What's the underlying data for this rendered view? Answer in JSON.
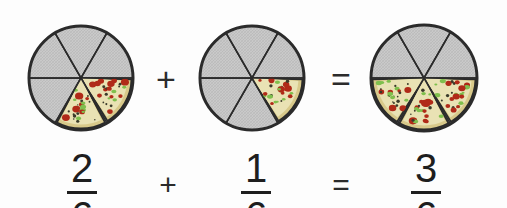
{
  "colors": {
    "background": "#fdfdfd",
    "empty_slice_fill": "#c9c9c9",
    "empty_slice_texture": "#b5b5b5",
    "crust_outer": "#2b2b2b",
    "crust_inner": "#d8c98a",
    "cheese": "#e9e2b4",
    "pepperoni": "#b02a18",
    "pepper_green": "#7fbf4d",
    "olive": "#3a3a2a",
    "slice_divider": "#2b2b2b",
    "text": "#1e1e1e"
  },
  "geometry": {
    "slices_total": 6,
    "slice_angle_degrees": 60,
    "radius": 52
  },
  "equation_top": {
    "operator_1": "+",
    "operator_2": "="
  },
  "equation_bottom": {
    "operator_1": "+",
    "operator_2": "="
  },
  "models": [
    {
      "name": "first-addend",
      "center_x": 81,
      "center_y": 78,
      "radius": 52,
      "slices_total": 6,
      "slices_filled": 2,
      "filled_indices": [
        0,
        1
      ],
      "fraction": {
        "numerator": "2",
        "denominator": "6"
      }
    },
    {
      "name": "second-addend",
      "center_x": 252,
      "center_y": 78,
      "radius": 52,
      "slices_total": 6,
      "slices_filled": 1,
      "filled_indices": [
        0
      ],
      "fraction": {
        "numerator": "1",
        "denominator": "6"
      }
    },
    {
      "name": "sum",
      "center_x": 424,
      "center_y": 78,
      "radius": 53,
      "slices_total": 6,
      "slices_filled": 3,
      "filled_indices": [
        0,
        1,
        2
      ],
      "fraction": {
        "numerator": "3",
        "denominator": "6"
      }
    }
  ],
  "fractions": {
    "first": {
      "numerator": "2",
      "denominator": "6"
    },
    "second": {
      "numerator": "1",
      "denominator": "6"
    },
    "result": {
      "numerator": "3",
      "denominator": "6"
    }
  }
}
